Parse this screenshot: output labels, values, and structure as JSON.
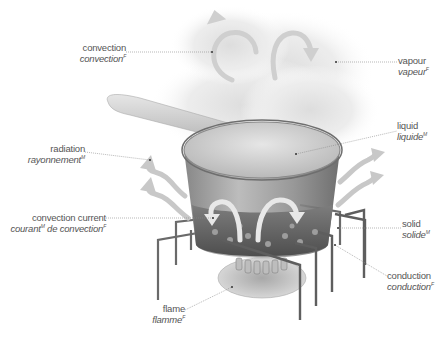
{
  "diagram": {
    "labels": [
      {
        "id": "convection",
        "en": "convection",
        "fr": "convection",
        "gender": "F"
      },
      {
        "id": "vapour",
        "en": "vapour",
        "fr": "vapeur",
        "gender": "F"
      },
      {
        "id": "radiation",
        "en": "radiation",
        "fr": "rayonnement",
        "gender": "M"
      },
      {
        "id": "liquid",
        "en": "liquid",
        "fr": "liquide",
        "gender": "M"
      },
      {
        "id": "convection-current",
        "en": "convection current",
        "fr_part1": "courant",
        "gender1": "M",
        "fr_part2": " de convection",
        "gender2": "F"
      },
      {
        "id": "solid",
        "en": "solid",
        "fr": "solide",
        "gender": "M"
      },
      {
        "id": "conduction",
        "en": "conduction",
        "fr": "conduction",
        "gender": "F"
      },
      {
        "id": "flame",
        "en": "flame",
        "fr": "flamme",
        "gender": "F"
      }
    ]
  },
  "colors": {
    "label_text": "#555555",
    "leader_line": "#888888",
    "pot_glass": "#9a9a9a",
    "arrow_fill": "#c8c8c8",
    "stand_metal": "#6a6a6a",
    "steam": "#e9e9e9"
  }
}
